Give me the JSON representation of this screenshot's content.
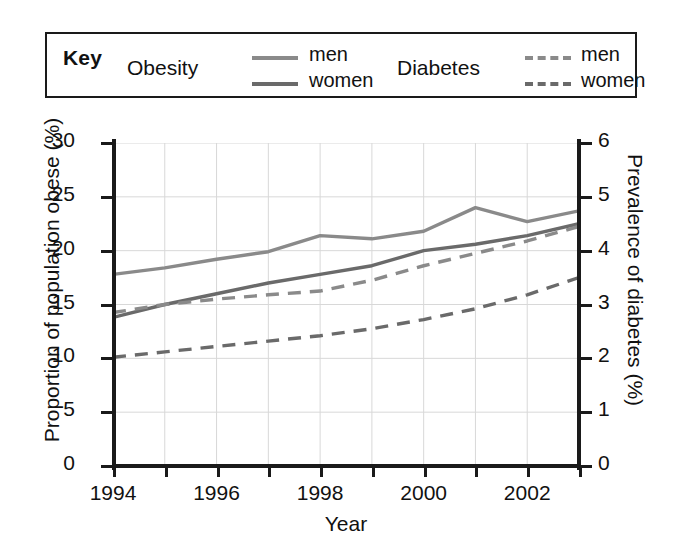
{
  "legend": {
    "key_label": "Key",
    "groups": [
      {
        "name": "Obesity",
        "entries": [
          {
            "label": "men",
            "style": "solid",
            "color": "#8a8a8a"
          },
          {
            "label": "women",
            "style": "solid",
            "color": "#6a6a6a"
          }
        ]
      },
      {
        "name": "Diabetes",
        "entries": [
          {
            "label": "men",
            "style": "dashed",
            "color": "#8a8a8a"
          },
          {
            "label": "women",
            "style": "dashed",
            "color": "#6a6a6a"
          }
        ]
      }
    ]
  },
  "chart_data": {
    "type": "line",
    "title": "",
    "xlabel": "Year",
    "ylabel": "Proportion of population obese (%)",
    "y2label": "Prevalence of diabetes (%)",
    "x": [
      1994,
      1995,
      1996,
      1997,
      1998,
      1999,
      2000,
      2001,
      2002,
      2003
    ],
    "xlim": [
      1994,
      2003
    ],
    "xticks": [
      1994,
      1996,
      1998,
      2000,
      2002
    ],
    "xticklabels": [
      "1994",
      "1996",
      "1998",
      "2000",
      "2002"
    ],
    "xminorticks": [
      1994,
      1995,
      1996,
      1997,
      1998,
      1999,
      2000,
      2001,
      2002,
      2003
    ],
    "ylim": [
      0,
      30
    ],
    "yticks": [
      0,
      5,
      10,
      15,
      20,
      25,
      30
    ],
    "yticklabels": [
      "0",
      "5",
      "10",
      "15",
      "20",
      "25",
      "30"
    ],
    "y2lim": [
      0,
      6
    ],
    "y2ticks": [
      0,
      1,
      2,
      3,
      4,
      5,
      6
    ],
    "y2ticklabels": [
      "0",
      "1",
      "2",
      "3",
      "4",
      "5",
      "6"
    ],
    "grid": true,
    "legend_position": "above-plot",
    "series": [
      {
        "name": "Obesity men",
        "group": "Obesity",
        "sex": "men",
        "axis": "left",
        "style": "solid",
        "color": "#8a8a8a",
        "unit": "%",
        "values": [
          17.8,
          18.4,
          19.2,
          19.9,
          21.4,
          21.1,
          21.8,
          24.0,
          22.7,
          23.7
        ]
      },
      {
        "name": "Obesity women",
        "group": "Obesity",
        "sex": "women",
        "axis": "left",
        "style": "solid",
        "color": "#6a6a6a",
        "unit": "%",
        "values": [
          13.8,
          15.0,
          16.0,
          17.0,
          17.8,
          18.6,
          20.0,
          20.6,
          21.4,
          22.5
        ]
      },
      {
        "name": "Diabetes men",
        "group": "Diabetes",
        "sex": "men",
        "axis": "right",
        "style": "dashed",
        "color": "#8a8a8a",
        "unit": "%",
        "values": [
          2.85,
          3.0,
          3.1,
          3.18,
          3.25,
          3.45,
          3.72,
          3.95,
          4.18,
          4.45
        ]
      },
      {
        "name": "Diabetes women",
        "group": "Diabetes",
        "sex": "women",
        "axis": "right",
        "style": "dashed",
        "color": "#6a6a6a",
        "unit": "%",
        "values": [
          2.02,
          2.12,
          2.22,
          2.32,
          2.42,
          2.55,
          2.72,
          2.92,
          3.18,
          3.5
        ]
      }
    ]
  }
}
